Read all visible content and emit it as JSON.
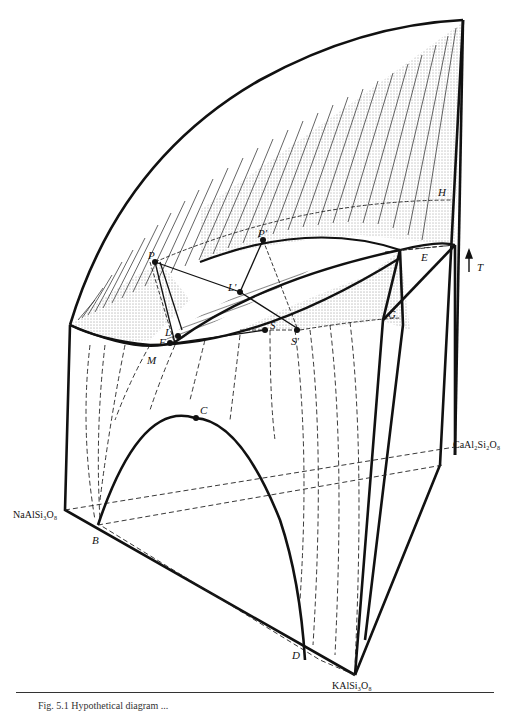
{
  "figure": {
    "type": "ternary temperature-composition phase diagram (3D prism sketch)",
    "axis": {
      "arrow_label": "T",
      "direction": "up"
    },
    "components": {
      "ab": "NaAlSi₃O₈",
      "an": "CaAl₂Si₂O₈",
      "or": "KAlSi₃O₈"
    },
    "points": {
      "P": "P",
      "P_prime": "P'",
      "L": "L",
      "L_prime": "L'",
      "F": "F",
      "M": "M",
      "S": "S",
      "S_prime": "S'",
      "G": "G",
      "E": "E",
      "H": "H",
      "C": "C",
      "B": "B",
      "D": "D"
    },
    "colors": {
      "ink": "#111111",
      "paper": "#ffffff"
    }
  },
  "caption": {
    "text": "Fig. 5.1  Hypothetical diagram ..."
  }
}
